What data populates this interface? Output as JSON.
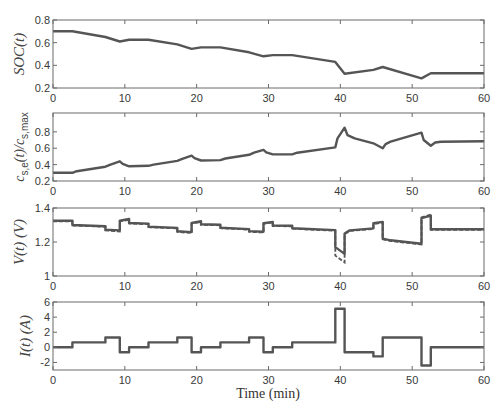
{
  "chart_data": [
    {
      "type": "line",
      "title": "",
      "xlabel": "",
      "ylabel": "SOC(t)",
      "xlim": [
        0,
        60
      ],
      "ylim": [
        0.2,
        0.8
      ],
      "xticks": [
        0,
        10,
        20,
        30,
        40,
        50,
        60
      ],
      "yticks": [
        0.2,
        0.4,
        0.6,
        0.8
      ],
      "grid": false,
      "series": [
        {
          "name": "SOC",
          "style": "solid",
          "x": [
            0,
            2.7,
            7.3,
            9.3,
            10.6,
            13.3,
            17.3,
            19.3,
            20.6,
            23.3,
            27.3,
            29.3,
            30.6,
            33.3,
            39.3,
            40.6,
            44.6,
            45.9,
            51.3,
            52.6,
            60
          ],
          "y": [
            0.7,
            0.7,
            0.65,
            0.61,
            0.625,
            0.625,
            0.585,
            0.545,
            0.558,
            0.558,
            0.515,
            0.48,
            0.49,
            0.49,
            0.43,
            0.325,
            0.36,
            0.385,
            0.285,
            0.33,
            0.33
          ]
        }
      ]
    },
    {
      "type": "line",
      "title": "",
      "xlabel": "",
      "ylabel": "c_s,e(t)/c_s,max",
      "xlim": [
        0,
        60
      ],
      "ylim": [
        0.2,
        1.03
      ],
      "xticks": [
        0,
        10,
        20,
        30,
        40,
        50,
        60
      ],
      "yticks": [
        0.2,
        0.4,
        0.6,
        0.8
      ],
      "grid": false,
      "series": [
        {
          "name": "c_se/c_smax",
          "style": "solid",
          "x": [
            0,
            2.7,
            3.3,
            7.3,
            8.0,
            9.3,
            9.7,
            10.6,
            13.3,
            14.0,
            17.3,
            18.0,
            19.3,
            19.7,
            20.6,
            23.3,
            24.0,
            27.3,
            28.0,
            29.3,
            29.7,
            30.6,
            33.3,
            34.0,
            39.3,
            39.6,
            40.6,
            41.0,
            42.0,
            44.6,
            45.9,
            46.3,
            47.0,
            51.3,
            51.6,
            52.6,
            53.2,
            54.0,
            60
          ],
          "y": [
            0.3,
            0.3,
            0.32,
            0.375,
            0.4,
            0.44,
            0.41,
            0.38,
            0.385,
            0.4,
            0.445,
            0.47,
            0.51,
            0.48,
            0.45,
            0.455,
            0.475,
            0.52,
            0.545,
            0.58,
            0.55,
            0.525,
            0.525,
            0.545,
            0.61,
            0.72,
            0.85,
            0.76,
            0.72,
            0.66,
            0.6,
            0.65,
            0.68,
            0.79,
            0.7,
            0.63,
            0.67,
            0.68,
            0.685
          ]
        }
      ]
    },
    {
      "type": "line",
      "title": "",
      "xlabel": "",
      "ylabel": "V(t) (V)",
      "xlim": [
        0,
        60
      ],
      "ylim": [
        1.0,
        1.4
      ],
      "xticks": [
        0,
        10,
        20,
        30,
        40,
        50,
        60
      ],
      "yticks": [
        1.0,
        1.2,
        1.4
      ],
      "grid": false,
      "series": [
        {
          "name": "V model",
          "style": "solid",
          "x": [
            0,
            2.7,
            2.7,
            7.3,
            7.3,
            9.3,
            9.3,
            10.6,
            10.6,
            13.3,
            13.3,
            17.3,
            17.3,
            19.3,
            19.3,
            20.6,
            20.6,
            23.3,
            23.3,
            27.3,
            27.3,
            29.3,
            29.3,
            30.6,
            30.6,
            33.3,
            33.3,
            39.3,
            39.3,
            40.6,
            40.6,
            41.3,
            44.6,
            44.6,
            45.9,
            45.9,
            47.0,
            51.3,
            51.3,
            52.6,
            52.6,
            60
          ],
          "y": [
            1.325,
            1.325,
            1.3,
            1.293,
            1.272,
            1.268,
            1.325,
            1.335,
            1.312,
            1.308,
            1.29,
            1.283,
            1.263,
            1.258,
            1.312,
            1.322,
            1.304,
            1.301,
            1.284,
            1.276,
            1.264,
            1.26,
            1.31,
            1.318,
            1.297,
            1.295,
            1.281,
            1.27,
            1.17,
            1.13,
            1.25,
            1.268,
            1.28,
            1.31,
            1.318,
            1.22,
            1.21,
            1.19,
            1.34,
            1.355,
            1.275,
            1.275
          ]
        },
        {
          "name": "V measured",
          "style": "dashed",
          "x": [
            0,
            2.7,
            2.7,
            7.3,
            7.3,
            9.3,
            9.3,
            10.6,
            10.6,
            13.3,
            13.3,
            17.3,
            17.3,
            19.3,
            19.3,
            20.6,
            20.6,
            23.3,
            23.3,
            27.3,
            27.3,
            29.3,
            29.3,
            30.6,
            30.6,
            33.3,
            33.3,
            39.3,
            39.3,
            40.6,
            40.6,
            41.3,
            44.6,
            44.6,
            45.9,
            45.9,
            47.0,
            51.3,
            51.3,
            52.6,
            52.6,
            60
          ],
          "y": [
            1.322,
            1.322,
            1.297,
            1.29,
            1.268,
            1.262,
            1.322,
            1.33,
            1.309,
            1.305,
            1.287,
            1.28,
            1.259,
            1.253,
            1.309,
            1.318,
            1.301,
            1.298,
            1.281,
            1.273,
            1.26,
            1.256,
            1.307,
            1.314,
            1.294,
            1.292,
            1.278,
            1.266,
            1.12,
            1.08,
            1.245,
            1.265,
            1.277,
            1.306,
            1.314,
            1.216,
            1.206,
            1.186,
            1.345,
            1.362,
            1.272,
            1.272
          ]
        }
      ]
    },
    {
      "type": "line",
      "title": "",
      "xlabel": "Time (min)",
      "ylabel": "I(t) (A)",
      "xlim": [
        0,
        60
      ],
      "ylim": [
        -3,
        6
      ],
      "xticks": [
        0,
        10,
        20,
        30,
        40,
        50,
        60
      ],
      "yticks": [
        -2,
        0,
        2,
        4,
        6
      ],
      "grid": false,
      "series": [
        {
          "name": "I",
          "style": "solid",
          "x": [
            0,
            2.7,
            2.7,
            7.3,
            7.3,
            9.3,
            9.3,
            10.6,
            10.6,
            13.3,
            13.3,
            17.3,
            17.3,
            19.3,
            19.3,
            20.6,
            20.6,
            23.3,
            23.3,
            27.3,
            27.3,
            29.3,
            29.3,
            30.6,
            30.6,
            33.3,
            33.3,
            39.3,
            39.3,
            40.6,
            40.6,
            44.6,
            44.6,
            45.9,
            45.9,
            51.3,
            51.3,
            52.6,
            52.6,
            60
          ],
          "y": [
            0,
            0,
            0.65,
            0.65,
            1.3,
            1.3,
            -0.65,
            -0.65,
            0,
            0,
            0.65,
            0.65,
            1.3,
            1.3,
            -0.65,
            -0.65,
            0,
            0,
            0.65,
            0.65,
            1.3,
            1.3,
            -0.65,
            -0.65,
            0,
            0,
            0.65,
            0.65,
            5.1,
            5.1,
            -0.65,
            -0.65,
            -1.2,
            -1.2,
            1.3,
            1.3,
            -2.4,
            -2.4,
            0,
            0
          ]
        }
      ]
    }
  ],
  "axes_labels": {
    "soc": "SOC(t)",
    "cse_main": "c",
    "cse_sub1": "s,e",
    "cse_mid": "(t)/c",
    "cse_sub2": "s,max",
    "voltage": "V(t) (V)",
    "current": "I(t) (A)",
    "time": "Time (min)"
  }
}
